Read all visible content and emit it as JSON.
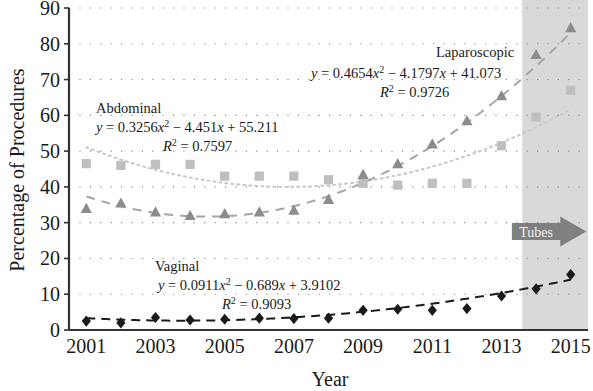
{
  "chart_data": {
    "type": "scatter",
    "title": "",
    "xlabel": "Year",
    "ylabel": "Percentage of Procedures",
    "xlim": [
      2000.5,
      2015.5
    ],
    "ylim": [
      0,
      90
    ],
    "ytick_step": 10,
    "xtick_step": 2,
    "grid": "dotted-horizontal",
    "legend_position": "inline-annotations",
    "x": [
      2001,
      2002,
      2003,
      2004,
      2005,
      2006,
      2007,
      2008,
      2009,
      2010,
      2011,
      2012,
      2013,
      2014,
      2015
    ],
    "xticks": [
      "2001",
      "2003",
      "2005",
      "2007",
      "2009",
      "2011",
      "2013",
      "2015"
    ],
    "yticks": [
      "0",
      "10",
      "20",
      "30",
      "40",
      "50",
      "60",
      "70",
      "80",
      "90"
    ],
    "series": [
      {
        "name": "Abdominal",
        "marker": "square",
        "color": "#bfbfbf",
        "line": "dotted",
        "values": [
          46.5,
          46.0,
          46.3,
          46.3,
          43.0,
          43.0,
          43.0,
          42.0,
          41.0,
          40.5,
          41.0,
          41.0,
          51.5,
          59.5,
          67.0
        ],
        "equation": "y = 0.3256x² − 4.451x + 55.211",
        "r_squared": "R² = 0.7597",
        "eq_coeffs": {
          "a": 0.3256,
          "b": -4.451,
          "c": 55.211,
          "r2": 0.7597
        }
      },
      {
        "name": "Laparoscopic",
        "marker": "triangle",
        "color": "#8c8c8c",
        "line": "dashed",
        "values": [
          34.0,
          35.5,
          33.0,
          32.0,
          32.5,
          33.0,
          33.5,
          36.5,
          43.5,
          46.5,
          52.0,
          58.5,
          65.5,
          77.0,
          84.5
        ],
        "equation": "y = 0.4654x² − 4.1797x + 41.073",
        "r_squared": "R² = 0.9726",
        "eq_coeffs": {
          "a": 0.4654,
          "b": -4.1797,
          "c": 41.073,
          "r2": 0.9726
        }
      },
      {
        "name": "Vaginal",
        "marker": "diamond",
        "color": "#1a1a1a",
        "line": "dashed",
        "values": [
          2.5,
          2.0,
          3.5,
          2.8,
          3.0,
          3.3,
          3.2,
          3.3,
          5.5,
          5.8,
          5.5,
          6.0,
          9.5,
          11.5,
          15.5
        ],
        "equation": "y = 0.0911x² − 0.689x + 3.9102",
        "r_squared": "R² = 0.9093",
        "eq_coeffs": {
          "a": 0.0911,
          "b": -0.689,
          "c": 3.9102,
          "r2": 0.9093
        }
      }
    ],
    "annotations": [
      {
        "name": "abdominal-annotation",
        "label": "Abdominal",
        "equation": "y = 0.3256x² − 4.451x + 55.211",
        "r_squared": "R² = 0.7597"
      },
      {
        "name": "laparoscopic-annotation",
        "label": "Laparoscopic",
        "equation": "y = 0.4654x² − 4.1797x + 41.073",
        "r_squared": "R² = 0.9726"
      },
      {
        "name": "vaginal-annotation",
        "label": "Vaginal",
        "equation": "y = 0.0911x² − 0.689x + 3.9102",
        "r_squared": "R² = 0.9093"
      }
    ],
    "shaded_region": {
      "label": "Tubes",
      "x_start": 2013.6,
      "x_end": 2015.5,
      "color": "#d9d9d9"
    },
    "arrow": {
      "label": "Tubes",
      "color": "#808080"
    }
  },
  "equation_parts": {
    "abdominal": {
      "y_eq": "y",
      "eq_assign": " = 0.3256",
      "var1": "x",
      "exp1": "2",
      "mid": " − 4.451",
      "var2": "x",
      "tail": " + 55.211",
      "r": "R",
      "r_exp": "2",
      "r_val": " = 0.7597"
    },
    "laparoscopic": {
      "y_eq": "y",
      "eq_assign": " = 0.4654",
      "var1": "x",
      "exp1": "2",
      "mid": " − 4.1797",
      "var2": "x",
      "tail": " + 41.073",
      "r": "R",
      "r_exp": "2",
      "r_val": " = 0.9726"
    },
    "vaginal": {
      "y_eq": "y",
      "eq_assign": " = 0.0911",
      "var1": "x",
      "exp1": "2",
      "mid": " − 0.689",
      "var2": "x",
      "tail": " + 3.9102",
      "r": "R",
      "r_exp": "2",
      "r_val": " = 0.9093"
    }
  },
  "axis": {
    "ylabel": "Percentage of Procedures",
    "xlabel": "Year",
    "yticks": [
      "90",
      "80",
      "70",
      "60",
      "50",
      "40",
      "30",
      "20",
      "10",
      "0"
    ],
    "xticks": [
      "2001",
      "2003",
      "2005",
      "2007",
      "2009",
      "2011",
      "2013",
      "2015"
    ]
  },
  "labels": {
    "abdominal": "Abdominal",
    "laparoscopic": "Laparoscopic",
    "vaginal": "Vaginal",
    "tubes": "Tubes"
  }
}
